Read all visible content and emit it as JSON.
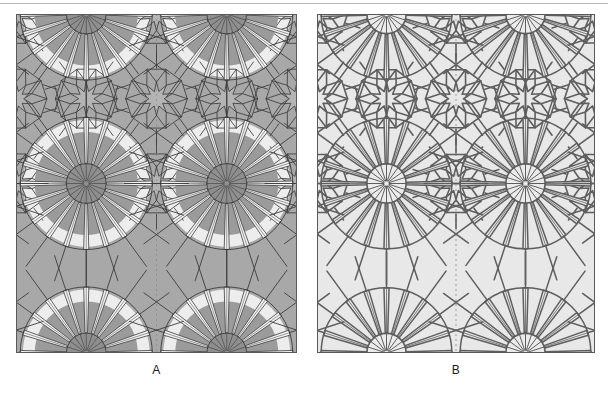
{
  "figure": {
    "type": "two-panel-comparison",
    "top_rule_visible": true,
    "background_color": "#ffffff"
  },
  "panels": [
    {
      "id": "A",
      "caption": "A",
      "description": "Shaded girih tiling with gray background and light rosette haloes",
      "x": 16,
      "y": 14,
      "width": 281,
      "height": 339,
      "style": "shaded",
      "colors": {
        "background": "#a8a8a8",
        "halo": "#ededed",
        "line": "#3c3c3c",
        "rosette_disk": "#8f8f8f",
        "ray_fill": "#f2f2f2",
        "border": "#5a5a5a"
      }
    },
    {
      "id": "B",
      "caption": "B",
      "description": "Line-only girih tiling, dark strapwork on light ground",
      "x": 317,
      "y": 14,
      "width": 278,
      "height": 339,
      "style": "line",
      "colors": {
        "background": "#e8e8e8",
        "halo": "#e8e8e8",
        "line": "#5e5e5e",
        "rosette_disk": "#ebebeb",
        "ray_fill": "#e8e8e8",
        "border": "#5a5a5a"
      }
    }
  ],
  "pattern": {
    "name": "decagonal girih rosette tiling",
    "symmetry_order": 10,
    "rosette_grid": {
      "columns": 2,
      "rows": 2,
      "full_rosettes": 2,
      "half_rosettes_top": 3,
      "half_rosettes_bottom": 3,
      "quarter_rosettes_corners": 4
    },
    "rosette_spokes": 20,
    "star_points": 10,
    "cell_width_fraction": 0.5,
    "cell_height_fraction": 0.5
  },
  "captions": {
    "a": "A",
    "b": "B"
  }
}
